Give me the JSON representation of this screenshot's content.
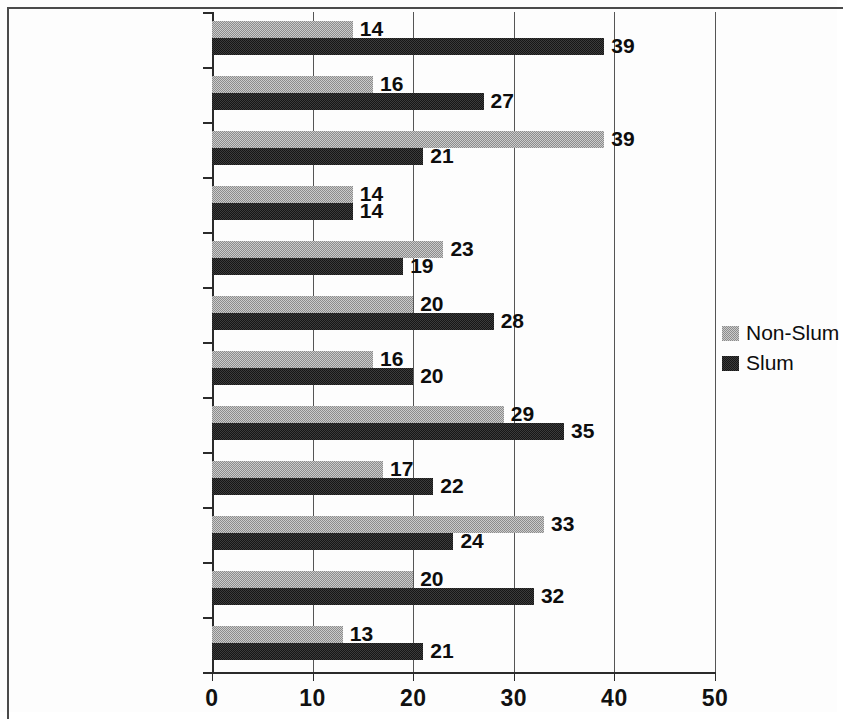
{
  "chart_data": {
    "type": "bar",
    "orientation": "horizontal",
    "title": "",
    "subtitle": "",
    "xlabel": "",
    "ylabel": "",
    "xlim": [
      0,
      50
    ],
    "xticks": [
      0,
      10,
      20,
      30,
      40,
      50
    ],
    "xtick_labels": [
      "0",
      "10",
      "20",
      "30",
      "40",
      "50"
    ],
    "grid": "vertical",
    "legend_position": "right",
    "categories": [
      "Mozambique",
      "Nigeria",
      "South Africa",
      "Uganda",
      "Zambia",
      "Bolivia",
      "Colombia",
      "Dominican Republic",
      "Peru",
      "Indonesia",
      "Kyrgyzstan",
      "Philippines"
    ],
    "series": [
      {
        "name": "Non-Slum",
        "color": "#8c8c8c",
        "values": [
          14,
          16,
          39,
          14,
          23,
          20,
          16,
          29,
          17,
          33,
          20,
          13
        ]
      },
      {
        "name": "Slum",
        "color": "#161616",
        "values": [
          39,
          27,
          21,
          14,
          19,
          28,
          20,
          35,
          22,
          24,
          32,
          21
        ]
      }
    ],
    "data_labels": {
      "Non-Slum": [
        "14",
        "16",
        "39",
        "14",
        "23",
        "20",
        "16",
        "29",
        "17",
        "33",
        "20",
        "13"
      ],
      "Slum": [
        "39",
        "27",
        "21",
        "14",
        "19",
        "28",
        "20",
        "35",
        "22",
        "24",
        "32",
        "21"
      ]
    }
  },
  "legend": {
    "items": [
      {
        "label": "Non-Slum",
        "swatch": "nonslum"
      },
      {
        "label": "Slum",
        "swatch": "slum"
      }
    ]
  }
}
